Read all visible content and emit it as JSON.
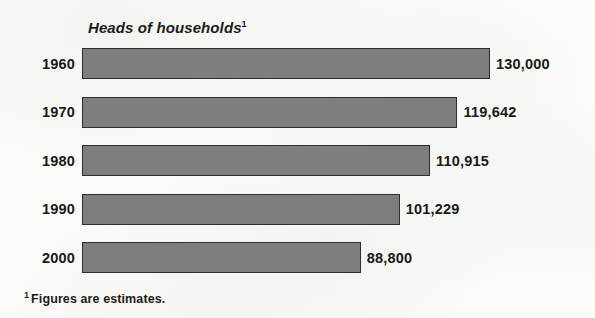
{
  "chart_data": {
    "type": "bar",
    "orientation": "horizontal",
    "title": "Heads of households",
    "title_footnote_marker": "1",
    "xlabel": "",
    "ylabel": "",
    "grid": false,
    "legend": null,
    "xlim": [
      0,
      130000
    ],
    "categories": [
      "1960",
      "1970",
      "1980",
      "1990",
      "2000"
    ],
    "values": [
      130000,
      119642,
      110915,
      101229,
      88800
    ],
    "value_labels": [
      "130,000",
      "119,642",
      "110,915",
      "101,229",
      "88,800"
    ],
    "bar_color": "#7e7e7e",
    "bar_border_color": "#2e2e2e",
    "footnote": "Figures are estimates.",
    "footnote_marker": "1"
  }
}
